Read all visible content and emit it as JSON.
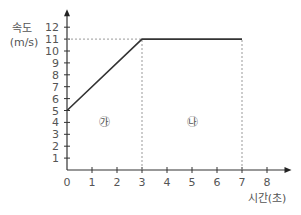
{
  "chart_data": {
    "type": "line",
    "title": "",
    "xlabel": "시간(초)",
    "ylabel": "속도 (m/s)",
    "ylabel_line1": "속도",
    "ylabel_line2": "(m/s)",
    "x": [
      0,
      3,
      7
    ],
    "series": [
      {
        "name": "velocity",
        "values": [
          5,
          11,
          11
        ]
      }
    ],
    "xticks": [
      "0",
      "1",
      "2",
      "3",
      "4",
      "5",
      "6",
      "7",
      "8"
    ],
    "yticks": [
      "1",
      "2",
      "3",
      "4",
      "5",
      "6",
      "7",
      "8",
      "9",
      "10",
      "11",
      "12"
    ],
    "xlim": [
      0,
      8.5
    ],
    "ylim": [
      0,
      12.5
    ],
    "annotations": [
      {
        "text": "㉮",
        "x": 1.5,
        "y": 4,
        "region": "0-3 s"
      },
      {
        "text": "㉯",
        "x": 5,
        "y": 4,
        "region": "3-7 s"
      }
    ],
    "guides": [
      {
        "type": "horizontal-dashed",
        "y": 11,
        "from_x": 0,
        "to_x": 3
      },
      {
        "type": "vertical-dashed",
        "x": 3,
        "from_y": 0,
        "to_y": 11
      },
      {
        "type": "vertical-dashed",
        "x": 7,
        "from_y": 0,
        "to_y": 11
      }
    ],
    "grid": false
  }
}
